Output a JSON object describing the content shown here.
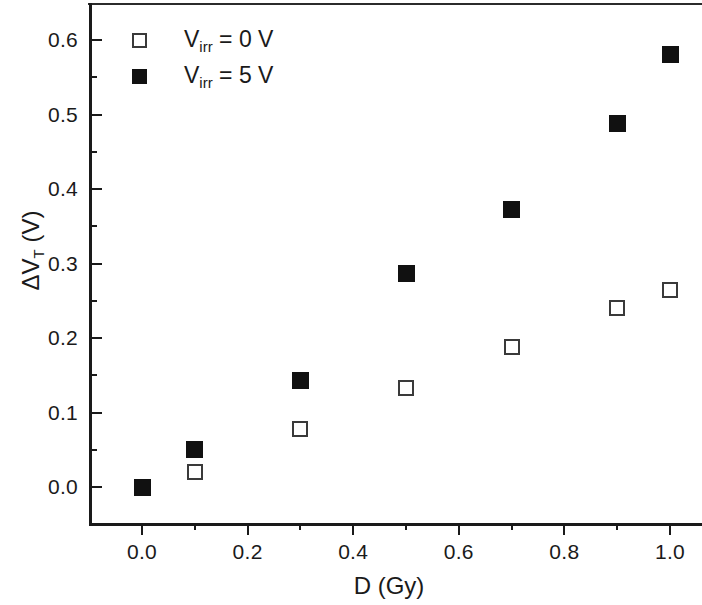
{
  "chart_data": {
    "type": "scatter",
    "title": "",
    "xlabel": "D (Gy)",
    "ylabel": "ΔV_T (V)",
    "ylabel_parts": {
      "prefix": "ΔV",
      "subscript": "T",
      "suffix": " (V)"
    },
    "xlabel_text": "D (Gy)",
    "xlim": [
      -0.08,
      1.08
    ],
    "ylim": [
      -0.035,
      0.655
    ],
    "xticks": [
      0.0,
      0.2,
      0.4,
      0.6,
      0.8,
      1.0
    ],
    "xtick_labels": [
      "0.0",
      "0.2",
      "0.4",
      "0.6",
      "0.8",
      "1.0"
    ],
    "xminor_step": 0.1,
    "yticks": [
      0.0,
      0.1,
      0.2,
      0.3,
      0.4,
      0.5,
      0.6
    ],
    "ytick_labels": [
      "0.0",
      "0.1",
      "0.2",
      "0.3",
      "0.4",
      "0.5",
      "0.6"
    ],
    "yminor_step": 0.05,
    "grid": false,
    "legend_position": "upper left",
    "series": [
      {
        "name": "V_irr = 0 V",
        "marker": "open-square",
        "color": "#3a3a3a",
        "x": [
          0.1,
          0.3,
          0.5,
          0.7,
          0.9,
          1.0
        ],
        "y": [
          0.02,
          0.078,
          0.133,
          0.188,
          0.24,
          0.265
        ]
      },
      {
        "name": "V_irr = 5 V",
        "marker": "filled-square",
        "color": "#111111",
        "x": [
          0.0,
          0.1,
          0.3,
          0.5,
          0.7,
          0.9,
          1.0
        ],
        "y": [
          0.0,
          0.05,
          0.143,
          0.287,
          0.372,
          0.488,
          0.58
        ]
      }
    ]
  },
  "legend": {
    "entries": [
      {
        "prefix": "V",
        "subscript": "irr",
        "suffix": " = 0 V",
        "marker": "open-square"
      },
      {
        "prefix": "V",
        "subscript": "irr",
        "suffix": " = 5 V",
        "marker": "filled-square"
      }
    ]
  },
  "axes": {
    "x_title": "D (Gy)",
    "y_title_prefix": "ΔV",
    "y_title_subscript": "T",
    "y_title_suffix": " (V)"
  },
  "colors": {
    "axis": "#1a1a1a",
    "open_marker_stroke": "#3a3a3a",
    "filled_marker": "#111111",
    "background": "#ffffff"
  }
}
